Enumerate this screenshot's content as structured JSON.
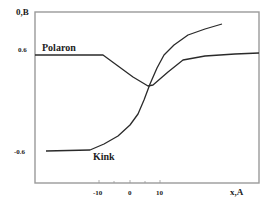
{
  "chart_data": {
    "type": "line",
    "title": "",
    "xlabel": "x,A",
    "ylabel": "0,B",
    "x_ticks": [
      -10,
      0,
      10
    ],
    "x_tick_labels": [
      "-10",
      "0",
      "10"
    ],
    "y_ticks": [
      0.6,
      -0.6
    ],
    "y_tick_labels": [
      "0.6",
      "-0.6"
    ],
    "xlim": [
      -33,
      42
    ],
    "ylim": [
      -0.6,
      0.6
    ],
    "grid": false,
    "legend": "inline labels",
    "series": [
      {
        "name": "Polaron",
        "x": [
          -33,
          -10,
          -5,
          0,
          5,
          10,
          15,
          20,
          30,
          42
        ],
        "y": [
          0.6,
          0.6,
          0.52,
          0.4,
          0.28,
          0.33,
          0.5,
          0.62,
          0.66,
          0.68
        ]
      },
      {
        "name": "Kink",
        "x": [
          -29,
          -15,
          -10,
          -5,
          0,
          5,
          10,
          15,
          20,
          25,
          30
        ],
        "y": [
          -0.6,
          -0.6,
          -0.55,
          -0.46,
          -0.3,
          -0.05,
          0.3,
          0.55,
          0.72,
          0.8,
          0.85
        ]
      }
    ],
    "annotations": [
      "Polaron",
      "Kink"
    ]
  },
  "axes": {
    "y_label": "0,B",
    "x_label": "x,A",
    "y_ticks": [
      "0.6",
      "-0.6"
    ],
    "x_ticks": [
      "-10",
      "0",
      "10"
    ]
  },
  "labels": {
    "polaron": "Polaron",
    "kink": "Kink"
  },
  "colors": {
    "frame": "#9a9a9a",
    "curve": "#2a2a2a",
    "text": "#222222"
  },
  "paths": {
    "polaron": "M35,55 L103,55 L118,66 L133,77 L148,86 L153,85 L168,72 L183,60 L205,56 L235,54 L259,53",
    "kink": "M46,151 L90,150 L104,144 L118,136 L130,125 L138,114 L144,100 L150,84 L157,68 L164,55 L174,45 L188,35 L205,29 L222,24"
  }
}
